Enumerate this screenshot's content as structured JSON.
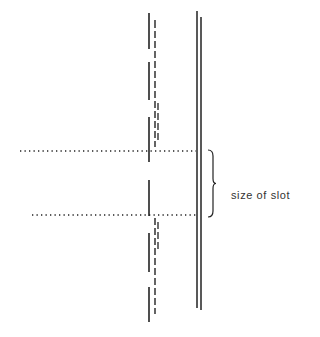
{
  "diagram": {
    "width": 320,
    "height": 337,
    "stroke_color": "#222222",
    "label": {
      "text": "size of slot",
      "x": 231,
      "y": 189
    },
    "solid_line": {
      "x": 149,
      "segments": [
        [
          13,
          49
        ],
        [
          62,
          100
        ],
        [
          117,
          162
        ],
        [
          180,
          216
        ],
        [
          233,
          272
        ],
        [
          287,
          322
        ]
      ]
    },
    "dashed_line": {
      "x": 155,
      "dashes": [
        [
          20,
          28
        ],
        [
          31,
          38
        ],
        [
          41,
          48
        ],
        [
          51,
          58
        ],
        [
          61,
          68
        ],
        [
          71,
          78
        ],
        [
          81,
          88
        ],
        [
          91,
          98
        ],
        [
          101,
          108
        ],
        [
          111,
          118
        ],
        [
          121,
          128
        ],
        [
          131,
          138
        ],
        [
          141,
          147
        ],
        [
          218,
          225
        ],
        [
          228,
          235
        ],
        [
          238,
          245
        ],
        [
          248,
          255
        ],
        [
          258,
          265
        ],
        [
          268,
          275
        ],
        [
          278,
          285
        ],
        [
          288,
          295
        ],
        [
          298,
          305
        ],
        [
          308,
          314
        ]
      ]
    },
    "dashed_line_double": {
      "x": 158,
      "dashes": [
        [
          103,
          110
        ],
        [
          113,
          120
        ],
        [
          123,
          130
        ],
        [
          133,
          140
        ],
        [
          222,
          229
        ],
        [
          232,
          239
        ],
        [
          242,
          249
        ]
      ]
    },
    "slot_wall": {
      "lines": [
        {
          "x": 197,
          "y1": 11,
          "y2": 308
        },
        {
          "x": 201,
          "y1": 17,
          "y2": 310
        }
      ]
    },
    "dotted_guides": [
      {
        "y": 151,
        "x1": 20,
        "x2": 196
      },
      {
        "y": 215,
        "x1": 32,
        "x2": 196
      }
    ],
    "brace": {
      "x": 208,
      "y1": 150,
      "y2": 217,
      "tip_x": 216
    }
  }
}
